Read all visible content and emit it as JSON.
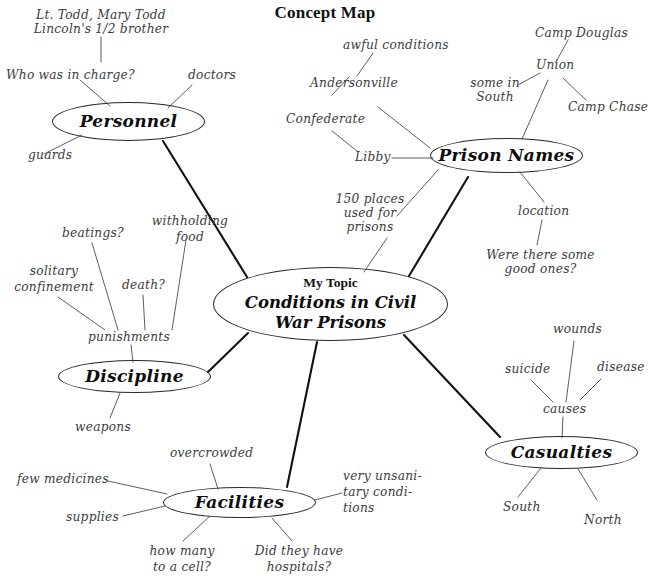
{
  "page": {
    "title": "Concept Map",
    "background_color": "#ffffff",
    "ink_color": "#3c3c3c",
    "node_stroke_color": "#2a2a2a",
    "main_edge_color": "#111111"
  },
  "center_node": {
    "eyebrow": "My Topic",
    "topic_line1": "Conditions in Civil",
    "topic_line2": "War Prisons"
  },
  "branches": {
    "personnel": {
      "label": "Personnel",
      "leaves": {
        "lt_todd_line1": "Lt. Todd, Mary Todd",
        "lt_todd_line2": "Lincoln's 1/2 brother",
        "who_in_charge": "Who was in charge?",
        "doctors": "doctors",
        "guards": "guards"
      }
    },
    "prison_names": {
      "label": "Prison Names",
      "leaves": {
        "awful_conditions": "awful conditions",
        "andersonville": "Andersonville",
        "confederate": "Confederate",
        "libby": "Libby",
        "places_line1": "150 places",
        "places_line2": "used for",
        "places_line3": "prisons",
        "union": "Union",
        "camp_douglas": "Camp Douglas",
        "camp_chase": "Camp Chase",
        "some_in_line1": "some in",
        "some_in_line2": "South",
        "location": "location",
        "good_ones_line1": "Were there some",
        "good_ones_line2": "good ones?"
      }
    },
    "discipline": {
      "label": "Discipline",
      "leaves": {
        "punishments": "punishments",
        "beatings": "beatings?",
        "solitary_line1": "solitary",
        "solitary_line2": "confinement",
        "death": "death?",
        "withholding_line1": "withholding",
        "withholding_line2": "food",
        "weapons": "weapons"
      }
    },
    "facilities": {
      "label": "Facilities",
      "leaves": {
        "overcrowded": "overcrowded",
        "few_medicines": "few medicines",
        "supplies": "supplies",
        "unsanitary_line1": "very unsani-",
        "unsanitary_line2": "tary condi-",
        "unsanitary_line3": "tions",
        "how_many_line1": "how many",
        "how_many_line2": "to a cell?",
        "hospitals_line1": "Did they have",
        "hospitals_line2": "hospitals?"
      }
    },
    "casualties": {
      "label": "Casualties",
      "leaves": {
        "causes": "causes",
        "wounds": "wounds",
        "suicide": "suicide",
        "disease": "disease",
        "south": "South",
        "north": "North"
      }
    }
  }
}
